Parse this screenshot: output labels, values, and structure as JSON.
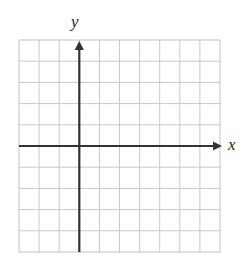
{
  "figure": {
    "kind": "coordinate-plane",
    "title": "",
    "background_color": "#ffffff",
    "width": 244,
    "height": 268
  },
  "axes": {
    "x_label": "x",
    "y_label": "y",
    "axis_color": "#333333",
    "axis_line_width": 2.2,
    "x_axis_has_arrow": true,
    "y_axis_has_arrow": true,
    "x_arrow_direction": "right",
    "y_arrow_direction": "up"
  },
  "grid": {
    "visible": true,
    "line_color": "#c9c9c9",
    "border_color": "#bdbdbd",
    "line_width": 1,
    "columns": 10,
    "rows": 10,
    "left": 19,
    "top": 40,
    "right": 220,
    "bottom": 252,
    "cell_width": 20.1,
    "cell_height": 21.2,
    "origin_column_index": 3,
    "origin_row_index": 5
  },
  "chart_data": {
    "type": "scatter",
    "title": "",
    "xlabel": "x",
    "ylabel": "y",
    "xlim": [
      -3,
      7
    ],
    "ylim": [
      -5,
      5
    ],
    "x_tick_labels": [],
    "y_tick_labels": [],
    "xticks": [
      -3,
      -2,
      -1,
      0,
      1,
      2,
      3,
      4,
      5,
      6,
      7
    ],
    "yticks": [
      -5,
      -4,
      -3,
      -2,
      -1,
      0,
      1,
      2,
      3,
      4,
      5
    ],
    "grid": true,
    "legend": false,
    "legend_position": "none",
    "annotations": [],
    "series": [
      {
        "name": "",
        "x": [],
        "y": []
      }
    ],
    "note": "Empty coordinate plane with no plotted data points or curves."
  }
}
